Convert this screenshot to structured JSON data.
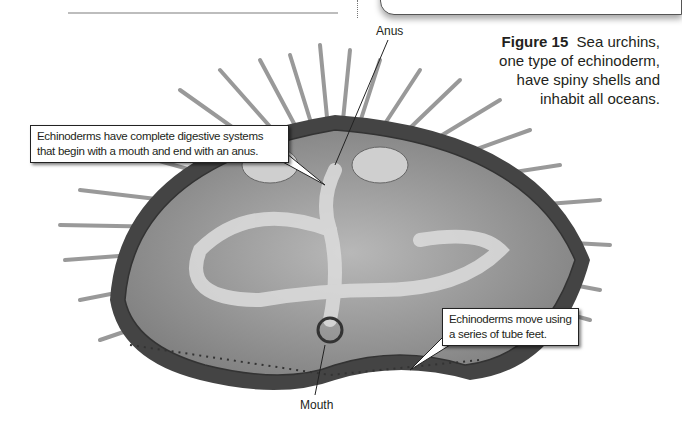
{
  "figure": {
    "label": "Figure 15",
    "caption_lines": [
      "Sea urchins,",
      "one type of echinoderm,",
      "have spiny shells and",
      "inhabit all oceans."
    ],
    "colors": {
      "body": "#9a9a9a",
      "spines": "#8c8c8c",
      "outline": "#222222"
    }
  },
  "labels": {
    "anus": "Anus",
    "mouth": "Mouth"
  },
  "callouts": [
    {
      "lines": [
        "Echinoderms have complete digestive systems",
        "that begin with a mouth and end with an anus."
      ]
    },
    {
      "lines": [
        "Echinoderms move using",
        "a series of tube feet."
      ]
    }
  ]
}
